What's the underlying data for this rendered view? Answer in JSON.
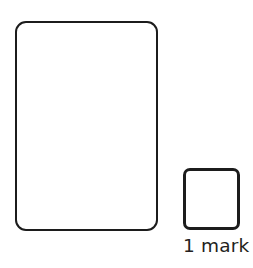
{
  "page": {
    "background_color": "#ffffff",
    "width": 253,
    "height": 268
  },
  "answer_box": {
    "label": "",
    "content": "",
    "stroke_color": "#1c1c1c",
    "fill_color": "#ffffff",
    "shape": "rounded-rectangle"
  },
  "mark_box": {
    "label": "",
    "content": "",
    "stroke_color": "#1c1c1c",
    "fill_color": "#ffffff",
    "shape": "rounded-square"
  },
  "mark_caption": {
    "text": "1 mark",
    "color": "#231f20"
  }
}
